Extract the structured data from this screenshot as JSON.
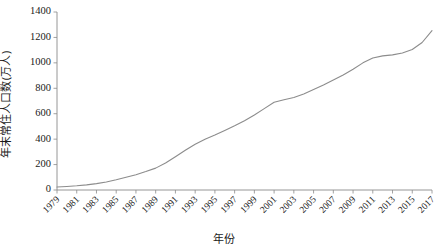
{
  "chart_data": {
    "type": "line",
    "title": "",
    "xlabel": "年份",
    "ylabel": "年末常住人口数(万人)",
    "xlim": [
      1979,
      2017
    ],
    "ylim": [
      0,
      1400
    ],
    "ytick_values": [
      0,
      200,
      400,
      600,
      800,
      1000,
      1200,
      1400
    ],
    "ytick_labels": [
      "0",
      "200",
      "400",
      "600",
      "800",
      "1000",
      "1200",
      "1400"
    ],
    "xtick_labels": [
      "1979",
      "1981",
      "1983",
      "1985",
      "1987",
      "1989",
      "1991",
      "1993",
      "1995",
      "1997",
      "1999",
      "2001",
      "2003",
      "2005",
      "2007",
      "2009",
      "2011",
      "2013",
      "2015",
      "2017"
    ],
    "grid": false,
    "legend": false,
    "line_color": "#8c8c8c",
    "axis_color": "#8a8a8a",
    "series": [
      {
        "name": "年末常住人口数",
        "x": [
          1979,
          1980,
          1981,
          1982,
          1983,
          1984,
          1985,
          1986,
          1987,
          1988,
          1989,
          1990,
          1991,
          1992,
          1993,
          1994,
          1995,
          1996,
          1997,
          1998,
          1999,
          2000,
          2001,
          2002,
          2003,
          2004,
          2005,
          2006,
          2007,
          2008,
          2009,
          2010,
          2011,
          2012,
          2013,
          2014,
          2015,
          2016,
          2017
        ],
        "values": [
          24,
          28,
          33,
          40,
          50,
          63,
          80,
          100,
          120,
          145,
          172,
          212,
          262,
          312,
          360,
          400,
          432,
          468,
          505,
          545,
          590,
          640,
          690,
          710,
          728,
          755,
          790,
          825,
          865,
          905,
          950,
          1000,
          1038,
          1055,
          1063,
          1078,
          1105,
          1160,
          1253
        ]
      }
    ]
  },
  "axis": {
    "x_title": "年份",
    "y_title": "年末常住人口数(万人)"
  }
}
